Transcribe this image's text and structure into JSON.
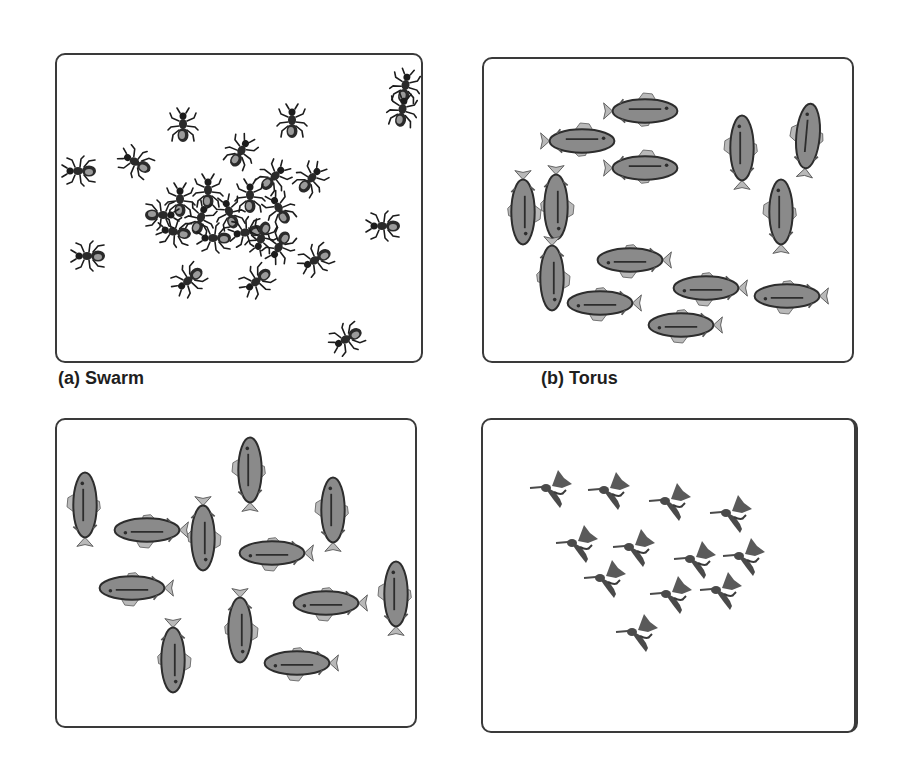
{
  "figure": {
    "panels": [
      {
        "id": "a",
        "caption": "(a) Swarm",
        "agent": "ant",
        "count": 27,
        "box": {
          "x": 55,
          "y": 53,
          "w": 368,
          "h": 310
        },
        "caption_pos": {
          "x": 58,
          "y": 368
        }
      },
      {
        "id": "b",
        "caption": "(b) Torus",
        "agent": "fish",
        "count": 15,
        "box": {
          "x": 482,
          "y": 57,
          "w": 372,
          "h": 306
        },
        "caption_pos": {
          "x": 541,
          "y": 368
        }
      },
      {
        "id": "c",
        "caption": "",
        "agent": "fish",
        "count": 13,
        "box": {
          "x": 55,
          "y": 418,
          "w": 362,
          "h": 310
        }
      },
      {
        "id": "d",
        "caption": "",
        "agent": "bird",
        "count": 12,
        "box": {
          "x": 481,
          "y": 418,
          "w": 377,
          "h": 315
        }
      }
    ],
    "colors": {
      "border": "#3a3a3a",
      "ant": "#1c1c1c",
      "fish_body": "#8a8a8a",
      "fish_fin": "#b9b9b9",
      "fish_outline": "#2d2d2d",
      "bird": "#4a4a4a",
      "caption": "#1e1e1e"
    }
  }
}
